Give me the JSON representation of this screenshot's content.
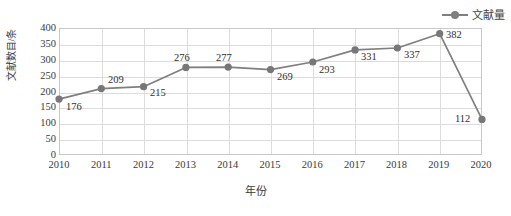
{
  "chart_data": {
    "type": "line",
    "title": "",
    "xlabel": "年份",
    "ylabel": "文献数目/条",
    "categories": [
      "2010",
      "2011",
      "2012",
      "2013",
      "2014",
      "2015",
      "2016",
      "2017",
      "2018",
      "2019",
      "2020"
    ],
    "values": [
      176,
      209,
      215,
      276,
      277,
      269,
      293,
      331,
      337,
      382,
      112
    ],
    "series": [
      {
        "name": "文献量",
        "values": [
          176,
          209,
          215,
          276,
          277,
          269,
          293,
          331,
          337,
          382,
          112
        ]
      }
    ],
    "ylim": [
      0,
      400
    ],
    "yticks": [
      0,
      50,
      100,
      150,
      200,
      250,
      300,
      350,
      400
    ],
    "ytick_labels": [
      "0",
      "50",
      "100",
      "150",
      "200",
      "250",
      "300",
      "350",
      "400"
    ],
    "xtick_labels": [
      "2010",
      "2011",
      "2012",
      "2013",
      "2014",
      "2015",
      "2016",
      "2017",
      "2018",
      "2019",
      "2020"
    ],
    "grid": "both",
    "legend_position": "top-right",
    "data_labels": [
      "176",
      "209",
      "215",
      "276",
      "277",
      "269",
      "293",
      "331",
      "337",
      "382",
      "112"
    ],
    "colors": {
      "series": "#7f7f7f",
      "marker": "#777777",
      "grid": "#dcdcdc",
      "frame": "#c9c9c9",
      "text": "#3a3a3a"
    }
  },
  "legend": {
    "entries": [
      {
        "label": "文献量",
        "symbol": "line-marker-icon"
      }
    ]
  }
}
